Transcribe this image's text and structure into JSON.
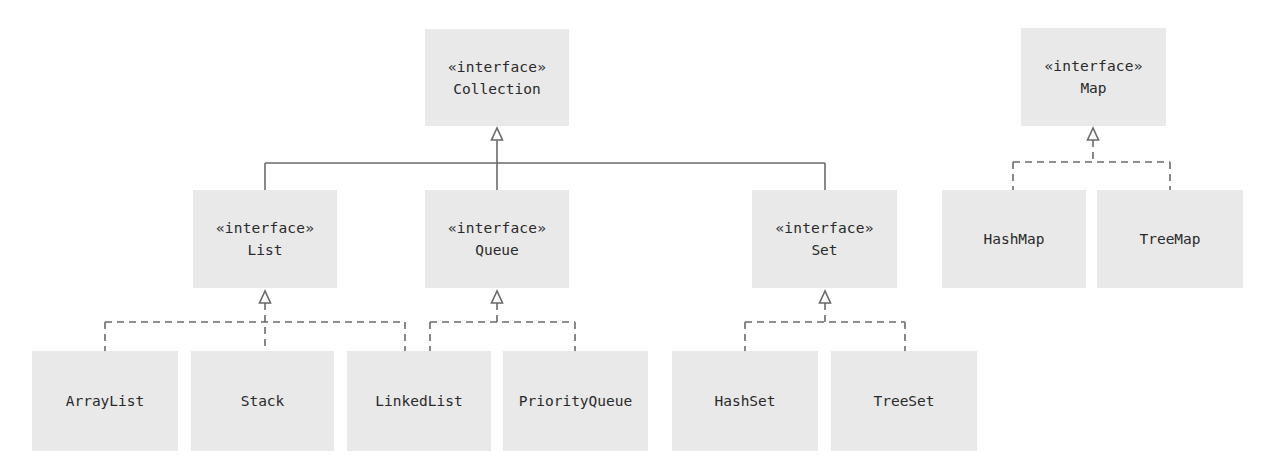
{
  "diagram": {
    "type": "UML class diagram",
    "colors": {
      "box_fill": "#e9e9e9",
      "line": "#6a6a6a",
      "text": "#2a2a2a",
      "background": "#ffffff"
    },
    "nodes": {
      "collection": {
        "stereotype": "«interface»",
        "name": "Collection",
        "kind": "interface"
      },
      "list": {
        "stereotype": "«interface»",
        "name": "List",
        "kind": "interface"
      },
      "queue": {
        "stereotype": "«interface»",
        "name": "Queue",
        "kind": "interface"
      },
      "set": {
        "stereotype": "«interface»",
        "name": "Set",
        "kind": "interface"
      },
      "map": {
        "stereotype": "«interface»",
        "name": "Map",
        "kind": "interface"
      },
      "arraylist": {
        "name": "ArrayList",
        "kind": "class"
      },
      "stack": {
        "name": "Stack",
        "kind": "class"
      },
      "linkedlist": {
        "name": "LinkedList",
        "kind": "class"
      },
      "priorityqueue": {
        "name": "PriorityQueue",
        "kind": "class"
      },
      "hashset": {
        "name": "HashSet",
        "kind": "class"
      },
      "treeset": {
        "name": "TreeSet",
        "kind": "class"
      },
      "hashmap": {
        "name": "HashMap",
        "kind": "class"
      },
      "treemap": {
        "name": "TreeMap",
        "kind": "class"
      }
    },
    "edges": [
      {
        "from": "List",
        "to": "Collection",
        "style": "solid",
        "relation": "extends"
      },
      {
        "from": "Queue",
        "to": "Collection",
        "style": "solid",
        "relation": "extends"
      },
      {
        "from": "Set",
        "to": "Collection",
        "style": "solid",
        "relation": "extends"
      },
      {
        "from": "ArrayList",
        "to": "List",
        "style": "dashed",
        "relation": "implements"
      },
      {
        "from": "Stack",
        "to": "List",
        "style": "dashed",
        "relation": "implements"
      },
      {
        "from": "LinkedList",
        "to": "List",
        "style": "dashed",
        "relation": "implements"
      },
      {
        "from": "LinkedList",
        "to": "Queue",
        "style": "dashed",
        "relation": "implements"
      },
      {
        "from": "PriorityQueue",
        "to": "Queue",
        "style": "dashed",
        "relation": "implements"
      },
      {
        "from": "HashSet",
        "to": "Set",
        "style": "dashed",
        "relation": "implements"
      },
      {
        "from": "TreeSet",
        "to": "Set",
        "style": "dashed",
        "relation": "implements"
      },
      {
        "from": "HashMap",
        "to": "Map",
        "style": "dashed",
        "relation": "implements"
      },
      {
        "from": "TreeMap",
        "to": "Map",
        "style": "dashed",
        "relation": "implements"
      }
    ]
  }
}
